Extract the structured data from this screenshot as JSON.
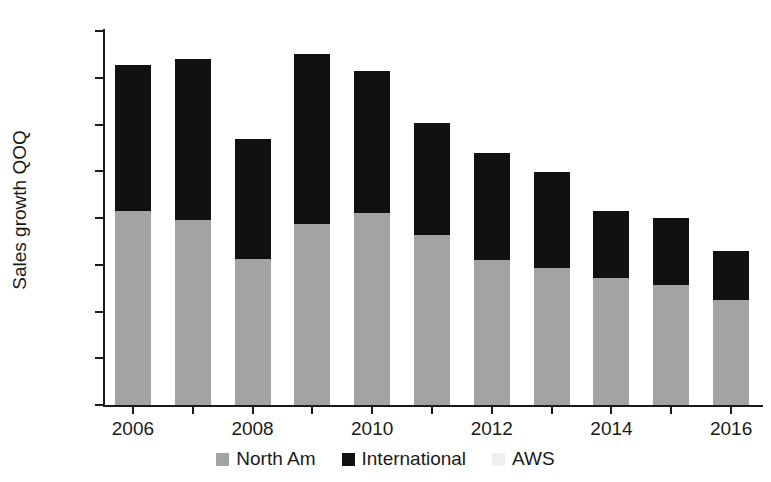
{
  "chart_data": {
    "type": "bar",
    "title": "",
    "xlabel": "",
    "ylabel": "Sales growth QOQ",
    "stacked": true,
    "grid": false,
    "legend_position": "bottom",
    "ylim": [
      0,
      80
    ],
    "ytick_labels": [
      "0%",
      "10%",
      "20%",
      "30%",
      "40%",
      "50%",
      "60%",
      "70%",
      "80%"
    ],
    "ytick_values": [
      0,
      10,
      20,
      30,
      40,
      50,
      60,
      70,
      80
    ],
    "categories": [
      "2006",
      "2007",
      "2008",
      "2009",
      "2010",
      "2011",
      "2012",
      "2013",
      "2014",
      "2015",
      "2016"
    ],
    "xtick_labels": [
      "2006",
      "",
      "2008",
      "",
      "2010",
      "",
      "2012",
      "",
      "2014",
      "",
      "2016"
    ],
    "series": [
      {
        "name": "North Am",
        "color": "#a3a3a3",
        "values": [
          41.5,
          39.5,
          31.2,
          38.7,
          41.0,
          36.3,
          31.0,
          29.3,
          27.1,
          25.7,
          22.4
        ]
      },
      {
        "name": "International",
        "color": "#111111",
        "values": [
          31.3,
          34.6,
          25.8,
          36.3,
          30.5,
          24.0,
          23.0,
          20.6,
          14.3,
          14.3,
          10.6
        ]
      },
      {
        "name": "AWS",
        "color": "#f0f0f0",
        "values": [
          0,
          0,
          0,
          0,
          0,
          0,
          0,
          0,
          0,
          0,
          0
        ]
      }
    ],
    "totals": [
      72.8,
      74.1,
      57.0,
      75.0,
      71.5,
      60.3,
      54.0,
      49.9,
      41.4,
      40.0,
      33.0
    ]
  },
  "legend": {
    "items": [
      {
        "label": "North Am",
        "color": "#a3a3a3"
      },
      {
        "label": "International",
        "color": "#111111"
      },
      {
        "label": "AWS",
        "color": "#f0f0f0"
      }
    ]
  },
  "colors": {
    "background": "#ffffff",
    "axis": "#1a1a1a",
    "text": "#1a1a1a",
    "north_am": "#a3a3a3",
    "international": "#111111",
    "aws": "#f0f0f0"
  }
}
